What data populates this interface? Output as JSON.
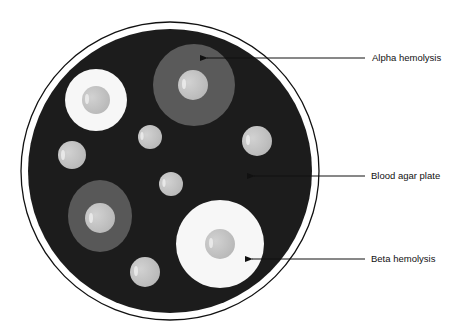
{
  "labels": {
    "alpha": "Alpha hemolysis",
    "blood_agar": "Blood agar plate",
    "beta": "Beta hemolysis"
  },
  "colors": {
    "agar": "#1c1c1c",
    "alpha_halo": "#5a5a5a",
    "beta_halo": "#f7f7f7",
    "colony": "#c4c4c4",
    "plate_rim": "#111111"
  }
}
